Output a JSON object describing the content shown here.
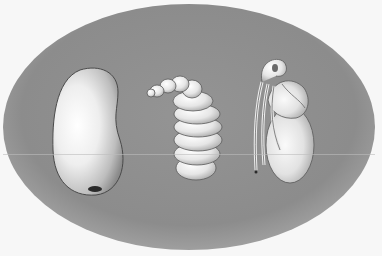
{
  "illustration": {
    "subject": "insect life stages",
    "stages": [
      {
        "name": "egg"
      },
      {
        "name": "larva"
      },
      {
        "name": "pupa"
      }
    ]
  },
  "colors": {
    "page_background": "#f7f7f7",
    "oval_fill": "#8e8e8e",
    "oval_edge": "#7a7a7a",
    "specimen_light": "#f2f2f2",
    "specimen_shadow": "#9a9a9a",
    "outline": "#3a3a3a"
  }
}
